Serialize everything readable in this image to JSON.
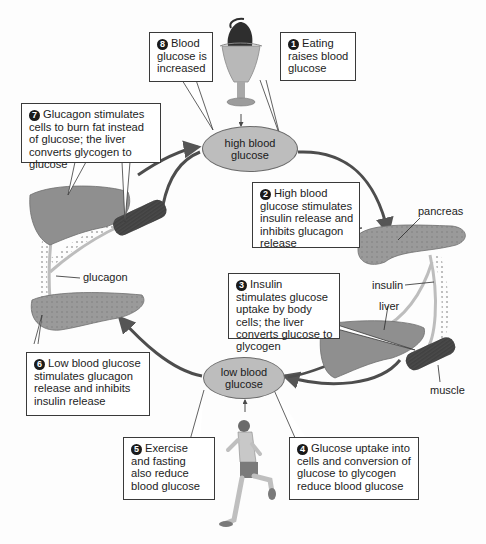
{
  "nodes": {
    "high": {
      "label": "high blood glucose"
    },
    "low": {
      "label": "low blood glucose"
    }
  },
  "steps": [
    {
      "number": "1",
      "text": "Eating raises blood glucose"
    },
    {
      "number": "2",
      "text": "High blood glucose stimulates insulin release and inhibits glucagon release"
    },
    {
      "number": "3",
      "text": "Insulin stimulates glucose uptake by body cells; the liver converts glucose to glycogen"
    },
    {
      "number": "4",
      "text": "Glucose uptake into cells and conversion of glucose to glycogen reduce blood glucose"
    },
    {
      "number": "5",
      "text": "Exercise and fasting also reduce blood glucose"
    },
    {
      "number": "6",
      "text": "Low blood glucose stimulates glucagon release and inhibits insulin release"
    },
    {
      "number": "7",
      "text": "Glucagon stimulates cells to burn fat instead of glucose; the liver converts glycogen to glucose"
    },
    {
      "number": "8",
      "text": "Blood glucose is increased"
    }
  ],
  "labels": {
    "pancreas": "pancreas",
    "insulin": "insulin",
    "liver": "liver",
    "muscle": "muscle",
    "glucagon": "glucagon"
  },
  "images": {
    "sundae": "ice-cream-sundae",
    "runner": "running-man",
    "liver_right": "liver",
    "liver_left": "liver",
    "pancreas_right": "pancreas",
    "pancreas_left": "pancreas",
    "muscle_right": "muscle",
    "muscle_left": "muscle"
  },
  "colors": {
    "node_fill": "#bdbdbd",
    "organ_fill": "#8f8f8f",
    "arrow": "#555555",
    "hormone_path": "#b0b0b0"
  }
}
